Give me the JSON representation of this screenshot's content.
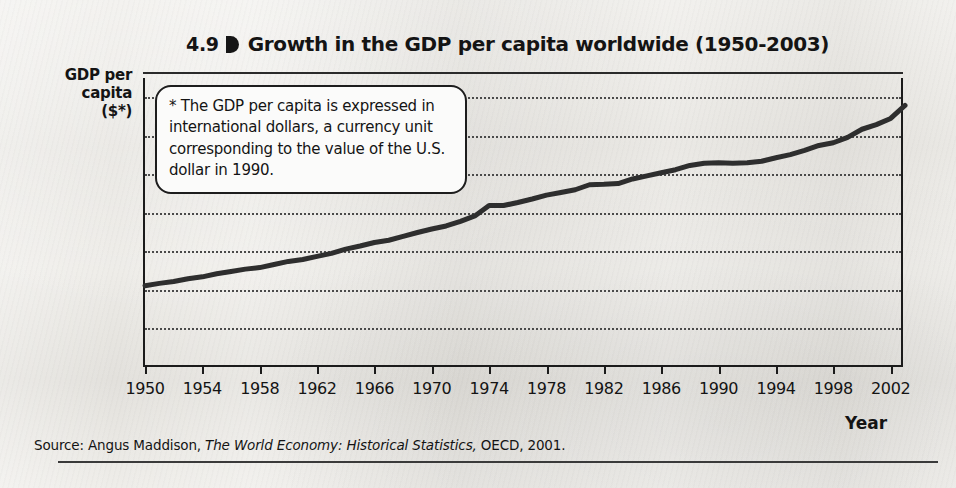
{
  "figure": {
    "number": "4.9",
    "marker_icon": "right-pointer-marker-icon",
    "title": "Growth in the GDP per capita worldwide (1950-2003)"
  },
  "y_axis": {
    "title_line1": "GDP per",
    "title_line2": "capita",
    "title_line3": "($*)"
  },
  "x_axis": {
    "title": "Year"
  },
  "callout": {
    "text": "* The GDP per capita is expressed in international dollars, a currency unit corresponding to the value of the U.S. dollar in 1990."
  },
  "source": {
    "prefix": "Source: Angus Maddison,",
    "italic": "The World Economy: Historical Statistics,",
    "suffix": "OECD, 2001."
  },
  "colors": {
    "line": "#2e2e2e",
    "frame": "#1b1b1b",
    "grid": "#4a4a4a",
    "paper": "#eae8e3",
    "callout_background": "#fbfbfa"
  },
  "chart_data": {
    "type": "line",
    "title": "Growth in the GDP per capita worldwide (1950-2003)",
    "xlabel": "Year",
    "ylabel": "GDP per capita ($*)",
    "xlim": [
      1950,
      2003
    ],
    "ylim": [
      0,
      7500
    ],
    "grid": true,
    "legend": null,
    "ytick_labels": [
      "7,000",
      "6,000",
      "5,000",
      "4,000",
      "3,000",
      "2,000",
      "1,000",
      "0"
    ],
    "ytick_values": [
      7000,
      6000,
      5000,
      4000,
      3000,
      2000,
      1000,
      0
    ],
    "xtick_labels": [
      "1950",
      "1954",
      "1958",
      "1962",
      "1966",
      "1970",
      "1974",
      "1978",
      "1982",
      "1986",
      "1990",
      "1994",
      "1998",
      "2002"
    ],
    "xtick_values": [
      1950,
      1954,
      1958,
      1962,
      1966,
      1970,
      1974,
      1978,
      1982,
      1986,
      1990,
      1994,
      1998,
      2002
    ],
    "series": [
      {
        "name": "GDP per capita (international 1990 dollars)",
        "x": [
          1950,
          1951,
          1952,
          1953,
          1954,
          1955,
          1956,
          1957,
          1958,
          1959,
          1960,
          1961,
          1962,
          1963,
          1964,
          1965,
          1966,
          1967,
          1968,
          1969,
          1970,
          1971,
          1972,
          1973,
          1974,
          1975,
          1976,
          1977,
          1978,
          1979,
          1980,
          1981,
          1982,
          1983,
          1984,
          1985,
          1986,
          1987,
          1988,
          1989,
          1990,
          1991,
          1992,
          1993,
          1994,
          1995,
          1996,
          1997,
          1998,
          1999,
          2000,
          2001,
          2002,
          2003
        ],
        "values": [
          2110,
          2170,
          2220,
          2290,
          2340,
          2420,
          2480,
          2540,
          2580,
          2660,
          2740,
          2790,
          2870,
          2950,
          3060,
          3140,
          3230,
          3290,
          3390,
          3490,
          3580,
          3660,
          3780,
          3920,
          4190,
          4190,
          4270,
          4360,
          4460,
          4530,
          4600,
          4730,
          4740,
          4760,
          4880,
          4960,
          5040,
          5120,
          5230,
          5290,
          5300,
          5290,
          5300,
          5340,
          5430,
          5510,
          5620,
          5750,
          5820,
          5960,
          6170,
          6290,
          6450,
          6790
        ]
      }
    ]
  }
}
